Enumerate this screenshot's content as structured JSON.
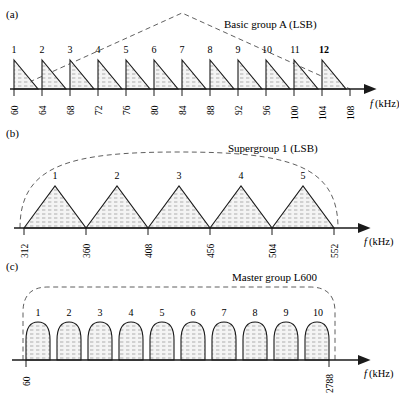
{
  "figure": {
    "type": "fdm-hierarchy-spectrum-diagram",
    "axis_label": "f (kHz)",
    "axis_label_italic": "f",
    "axis_label_rest": "(kHz)"
  },
  "panels": [
    {
      "key": "a",
      "label": "(a)",
      "title": "Basic group A (LSB)",
      "envelope": "triangular-dashed",
      "shape": "right-triangle-sawtooth",
      "channel_numbers": [
        "1",
        "2",
        "3",
        "4",
        "5",
        "6",
        "7",
        "8",
        "9",
        "10",
        "11",
        "12"
      ],
      "tick_labels": [
        "60",
        "64",
        "68",
        "72",
        "76",
        "80",
        "84",
        "88",
        "92",
        "96",
        "100",
        "104",
        "108"
      ],
      "band_start": 60,
      "band_end": 108,
      "channel_width": 4,
      "channel_count": 12,
      "units": "kHz"
    },
    {
      "key": "b",
      "label": "(b)",
      "title": "Supergroup 1 (LSB)",
      "envelope": "arc-dashed",
      "shape": "isosceles-triangle",
      "channel_numbers": [
        "1",
        "2",
        "3",
        "4",
        "5"
      ],
      "tick_labels": [
        "312",
        "360",
        "408",
        "456",
        "504",
        "552"
      ],
      "band_start": 312,
      "band_end": 552,
      "channel_width": 48,
      "channel_count": 5,
      "units": "kHz"
    },
    {
      "key": "c",
      "label": "(c)",
      "title": "Master group L600",
      "envelope": "rounded-rect-dashed",
      "shape": "dome",
      "channel_numbers": [
        "1",
        "2",
        "3",
        "4",
        "5",
        "6",
        "7",
        "8",
        "9",
        "10"
      ],
      "tick_labels": [
        "60",
        "2788"
      ],
      "band_start": 60,
      "band_end": 2788,
      "channel_count": 10,
      "units": "kHz"
    }
  ],
  "colors": {
    "stroke": "#1a1a1a",
    "fill_hatch": "#9a9a9a",
    "fill_background": "#f2f2f2",
    "dashed": "#4d4d4d",
    "text": "#1a1a1a"
  }
}
